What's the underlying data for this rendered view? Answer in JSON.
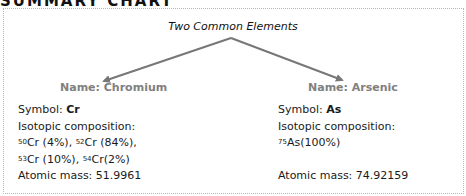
{
  "heading": "SUMMARY CHART",
  "title": "Two Common Elements",
  "colors": {
    "arrow": "#777777",
    "name": "#808080",
    "border": "#b8b8b8"
  },
  "left": {
    "name": "Name: Chromium",
    "symbol_label": "Symbol: ",
    "symbol": "Cr",
    "iso_label": "Isotopic composition:",
    "isotopes": [
      {
        "mass": "50",
        "text": "Cr (4%), "
      },
      {
        "mass": "52",
        "text": "Cr (84%),"
      },
      {
        "mass": "53",
        "text": "Cr (10%), "
      },
      {
        "mass": "54",
        "text": "Cr(2%)"
      }
    ],
    "atomic_mass": "Atomic mass: 51.9961"
  },
  "right": {
    "name": "Name: Arsenic",
    "symbol_label": "Symbol: ",
    "symbol": "As",
    "iso_label": "Isotopic composition:",
    "isotopes": [
      {
        "mass": "75",
        "text": "As(100%)"
      }
    ],
    "atomic_mass": "Atomic mass: 74.92159"
  }
}
